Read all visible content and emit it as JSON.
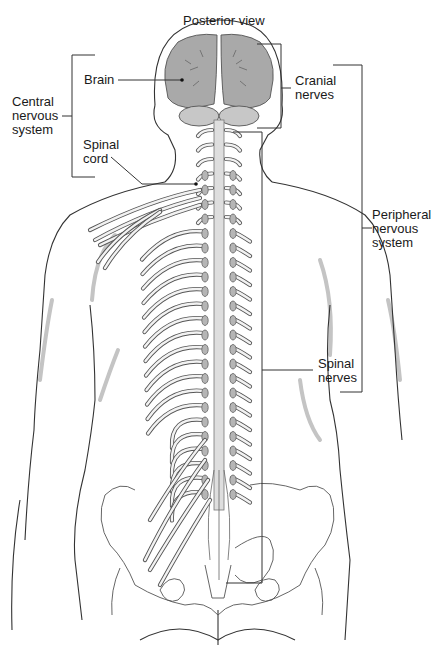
{
  "figure": {
    "title": "Posterior view",
    "colors": {
      "brain_fill": "#a9a9a9",
      "cerebellum_fill": "#c7c7c7",
      "body_shadow": "#c4c4c4",
      "line": "#333333",
      "background": "#ffffff"
    }
  },
  "labels": {
    "brain": "Brain",
    "spinal_cord": [
      "Spinal",
      "cord"
    ],
    "central_nervous_system": [
      "Central",
      "nervous",
      "system"
    ],
    "cranial_nerves": [
      "Cranial",
      "nerves"
    ],
    "peripheral_nervous_system": [
      "Peripheral",
      "nervous",
      "system"
    ],
    "spinal_nerves": [
      "Spinal",
      "nerves"
    ]
  },
  "groups": [
    {
      "name": "Central nervous system",
      "members": [
        "Brain",
        "Spinal cord"
      ]
    },
    {
      "name": "Peripheral nervous system",
      "members": [
        "Cranial nerves",
        "Spinal nerves"
      ]
    }
  ]
}
